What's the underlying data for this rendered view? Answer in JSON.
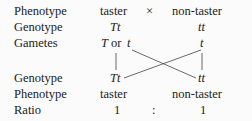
{
  "rows": {
    "phenotype1": {
      "label": "Phenotype",
      "left": "taster",
      "cross": "×",
      "right": "non-taster"
    },
    "genotype1": {
      "label": "Genotype",
      "left": "Tt",
      "right": "tt"
    },
    "gametes": {
      "label": "Gametes",
      "left_T": "T",
      "left_or": "or",
      "left_t": "t",
      "right": "t"
    },
    "genotype2": {
      "label": "Genotype",
      "left": "Tt",
      "right": "tt"
    },
    "phenotype2": {
      "label": "Phenotype",
      "left": "taster",
      "right": "non-taster"
    },
    "ratio": {
      "label": "Ratio",
      "left": "1",
      "sep": ":",
      "right": "1"
    }
  },
  "colors": {
    "text": "#222222",
    "lines": "#444444",
    "background": "#fbfbfb"
  }
}
